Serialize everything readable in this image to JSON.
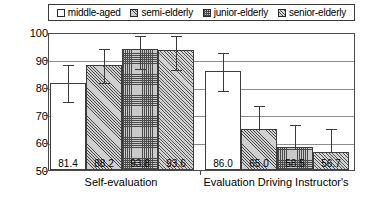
{
  "chart_data": {
    "type": "bar",
    "title": "",
    "xlabel": "",
    "ylabel": "",
    "ylim": [
      50,
      100
    ],
    "yticks": [
      50,
      60,
      70,
      80,
      90,
      100
    ],
    "grid": true,
    "legend_position": "top",
    "categories": [
      "Self-evaluation",
      "Evaluation Driving Instructor's"
    ],
    "series": [
      {
        "name": "middle-aged",
        "pattern": "plain",
        "values": [
          81.4,
          86.0
        ],
        "err_low": [
          6.0,
          6.5
        ],
        "err_high": [
          7.5,
          7.0
        ]
      },
      {
        "name": "semi-elderly",
        "pattern": "diagonal-hatch",
        "values": [
          88.2,
          65.0
        ],
        "err_low": [
          6.0,
          0.0
        ],
        "err_high": [
          6.5,
          9.0
        ]
      },
      {
        "name": "junior-elderly",
        "pattern": "cross-hatch",
        "values": [
          93.8,
          58.5
        ],
        "err_low": [
          6.5,
          0.0
        ],
        "err_high": [
          5.5,
          8.5
        ]
      },
      {
        "name": "senior-elderly",
        "pattern": "diagonal-hatch-2",
        "values": [
          93.6,
          56.7
        ],
        "err_low": [
          6.5,
          0.0
        ],
        "err_high": [
          5.5,
          9.0
        ]
      }
    ],
    "value_labels": [
      "81.4",
      "88.2",
      "93.8",
      "93.6",
      "86.0",
      "65.0",
      "58.5",
      "56.7"
    ]
  },
  "legend": {
    "items": [
      {
        "label": "middle-aged",
        "swatch": "legend-swatch-plain"
      },
      {
        "label": "semi-elderly",
        "swatch": "legend-swatch-diagonal"
      },
      {
        "label": "junior-elderly",
        "swatch": "legend-swatch-grid"
      },
      {
        "label": "senior-elderly",
        "swatch": "legend-swatch-diagonal2"
      }
    ]
  },
  "yaxis": {
    "labels": [
      "100",
      "90",
      "80",
      "70",
      "60",
      "50"
    ]
  },
  "xaxis": {
    "groups": [
      "Self-evaluation",
      "Evaluation Driving Instructor's"
    ]
  }
}
